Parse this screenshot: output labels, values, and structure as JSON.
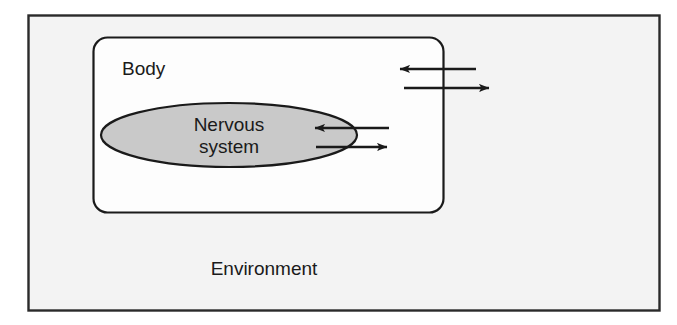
{
  "diagram": {
    "type": "nested-boxes-with-bidirectional-arrows",
    "colors": {
      "environment_fill": "#f3f3f3",
      "body_fill": "#fdfdfd",
      "nervous_system_fill": "#c9c9c9",
      "stroke": "#1a1a1a",
      "text": "#1a1a1a"
    },
    "regions": [
      {
        "name": "environment",
        "label": "Environment",
        "shape": "rectangle",
        "fill": "#f3f3f3",
        "bounds": {
          "x": 28,
          "y": 15,
          "width": 631,
          "height": 295
        },
        "label_position": {
          "x": 264,
          "y": 270
        }
      },
      {
        "name": "body",
        "label": "Body",
        "shape": "rounded-rectangle",
        "fill": "#fdfdfd",
        "corner_radius": 14,
        "bounds": {
          "x": 93,
          "y": 37,
          "width": 350,
          "height": 175
        },
        "label_position": {
          "x": 123,
          "y": 70
        }
      },
      {
        "name": "nervous-system",
        "label": "Nervous system",
        "label_lines": [
          "Nervous",
          "system"
        ],
        "shape": "ellipse",
        "fill": "#c9c9c9",
        "center": {
          "cx": 229,
          "cy": 135
        },
        "radii": {
          "rx": 128,
          "ry": 32
        }
      }
    ],
    "arrows": [
      {
        "name": "environment-to-body",
        "direction": "left",
        "description": "inbound from environment into body",
        "from": {
          "x": 476,
          "y": 69
        },
        "to": {
          "x": 398,
          "y": 69
        },
        "crosses": "body-boundary"
      },
      {
        "name": "body-to-environment",
        "direction": "right",
        "description": "outbound from body into environment",
        "from": {
          "x": 404,
          "y": 88
        },
        "to": {
          "x": 491,
          "y": 88
        },
        "crosses": "body-boundary"
      },
      {
        "name": "body-to-nervous-system",
        "direction": "left",
        "description": "inbound from body into nervous system",
        "from": {
          "x": 389,
          "y": 128
        },
        "to": {
          "x": 313,
          "y": 128
        },
        "crosses": "nervous-system-boundary"
      },
      {
        "name": "nervous-system-to-body",
        "direction": "right",
        "description": "outbound from nervous system into body",
        "from": {
          "x": 316,
          "y": 147
        },
        "to": {
          "x": 389,
          "y": 147
        },
        "crosses": "nervous-system-boundary"
      }
    ]
  }
}
